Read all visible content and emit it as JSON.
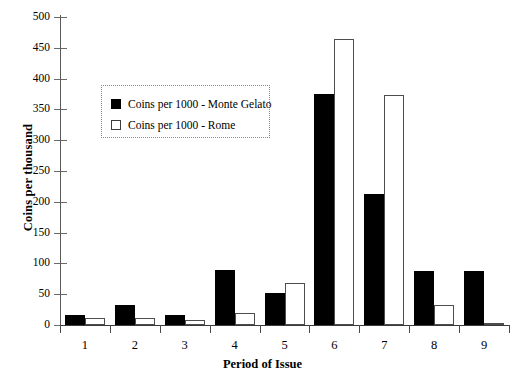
{
  "chart_data": {
    "type": "bar",
    "title": "",
    "xlabel": "Period of Issue",
    "ylabel": "Coins per thousand",
    "categories": [
      "1",
      "2",
      "3",
      "4",
      "5",
      "6",
      "7",
      "8",
      "9"
    ],
    "series": [
      {
        "name": "Coins per 1000 - Monte Gelato",
        "color": "#000000",
        "style": "filled",
        "values": [
          17,
          33,
          16,
          90,
          52,
          375,
          213,
          88,
          88
        ]
      },
      {
        "name": "Coins per 1000 - Rome",
        "color": "#ffffff",
        "style": "outlined",
        "values": [
          12,
          12,
          8,
          20,
          69,
          465,
          373,
          32,
          2
        ]
      }
    ],
    "ylim": [
      0,
      500
    ],
    "yticks": [
      0,
      50,
      100,
      150,
      200,
      250,
      300,
      350,
      400,
      450,
      500
    ],
    "ytick_labels": [
      "0",
      "50",
      "100",
      "150",
      "200",
      "250",
      "300",
      "350",
      "400",
      "450",
      "500"
    ],
    "grid": false,
    "legend_position": "upper-left-inset"
  },
  "legend": {
    "items": [
      {
        "label": "Coins per 1000 - Monte Gelato",
        "swatch": "dark"
      },
      {
        "label": "Coins per 1000 - Rome",
        "swatch": "light"
      }
    ]
  },
  "colors": {
    "background": "#ffffff",
    "axis": "#4a4a4a",
    "series_dark": "#000000",
    "series_light_fill": "#ffffff",
    "series_light_border": "#4d4d4d",
    "legend_border": "#8a8a8a"
  }
}
